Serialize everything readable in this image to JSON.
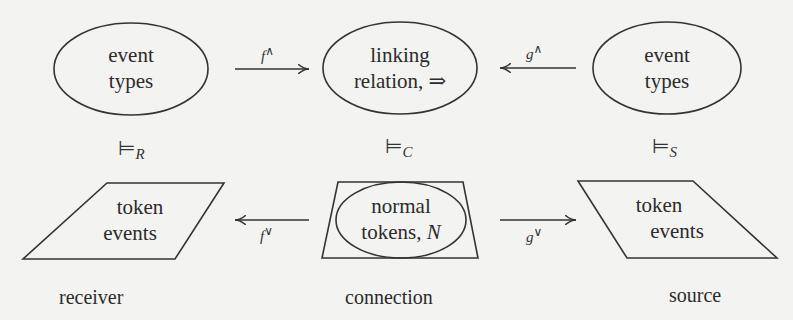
{
  "diagram": {
    "type": "channel-theory-diagram",
    "top_row": {
      "receiver_types": {
        "lines": [
          "event",
          "types"
        ]
      },
      "connection_types": {
        "lines": [
          "linking",
          "relation, ⇒"
        ]
      },
      "source_types": {
        "lines": [
          "event",
          "types"
        ]
      }
    },
    "top_arrows": {
      "f_up": {
        "symbol": "f",
        "superscript": "∧",
        "direction": "right"
      },
      "g_up": {
        "symbol": "g",
        "superscript": "∧",
        "direction": "left"
      }
    },
    "relations": {
      "receiver": {
        "symbol": "⊨",
        "subscript": "R"
      },
      "connection": {
        "symbol": "⊨",
        "subscript": "C"
      },
      "source": {
        "symbol": "⊨",
        "subscript": "S"
      }
    },
    "bottom_row": {
      "receiver_tokens": {
        "lines": [
          "token",
          "events"
        ]
      },
      "connection_tokens": {
        "lines": [
          "normal",
          "tokens, "
        ],
        "italic_suffix": "N"
      },
      "source_tokens": {
        "lines": [
          "token",
          "events"
        ]
      }
    },
    "bottom_arrows": {
      "f_down": {
        "symbol": "f",
        "superscript": "∨",
        "direction": "left"
      },
      "g_down": {
        "symbol": "g",
        "superscript": "∨",
        "direction": "right"
      }
    },
    "roles": {
      "receiver": "receiver",
      "connection": "connection",
      "source": "source"
    },
    "colors": {
      "background": "#f3f3f1",
      "stroke": "#333333",
      "text": "#2b2b2b"
    }
  }
}
